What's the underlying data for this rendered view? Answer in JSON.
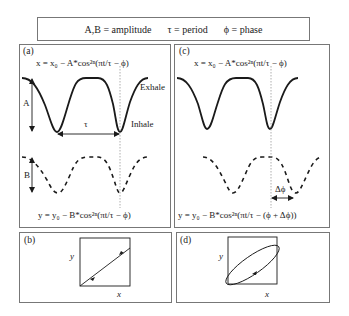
{
  "legend": {
    "items": [
      "A,B = amplitude",
      "τ = period",
      "ϕ = phase"
    ]
  },
  "panels": {
    "a": {
      "label": "(a)",
      "eq_top": "x = x₀ − A*cos²ⁿ(πt/τ − ϕ)",
      "eq_bottom": "y = y₀ − B*cos²ⁿ(πt/τ − ϕ)",
      "amp_top": "A",
      "amp_bottom": "B",
      "period": "τ",
      "exhale": "Exhale",
      "inhale": "Inhale"
    },
    "b": {
      "label": "(b)",
      "xlabel": "x",
      "ylabel": "y"
    },
    "c": {
      "label": "(c)",
      "eq_top": "x = x₀ − A*cos²ⁿ(πt/τ − ϕ)",
      "eq_bottom": "y = y₀ − B*cos²ⁿ(πt/τ − (ϕ + Δϕ))",
      "phase_shift": "Δϕ"
    },
    "d": {
      "label": "(d)",
      "xlabel": "x",
      "ylabel": "y"
    }
  },
  "colors": {
    "curve": "#1a1a1a",
    "border": "#777777",
    "guide": "#999999"
  }
}
